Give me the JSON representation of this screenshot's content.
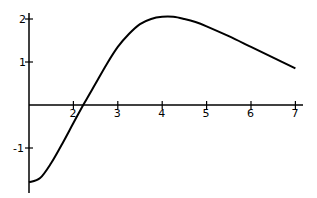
{
  "chart_data": {
    "type": "line",
    "title": "",
    "xlabel": "",
    "ylabel": "",
    "xlim": [
      1,
      7.2
    ],
    "ylim": [
      -1.9,
      2.2
    ],
    "grid": false,
    "legend": null,
    "x_ticks": [
      "2",
      "3",
      "4",
      "5",
      "6",
      "7"
    ],
    "y_ticks": [
      "2",
      "1",
      "-1"
    ],
    "series": [
      {
        "name": "f(x)",
        "x": [
          1.0,
          1.25,
          1.5,
          1.75,
          2.0,
          2.25,
          2.5,
          2.75,
          3.0,
          3.25,
          3.5,
          3.75,
          4.0,
          4.25,
          4.5,
          4.75,
          5.0,
          5.5,
          6.0,
          6.5,
          7.0
        ],
        "values": [
          -1.8,
          -1.7,
          -1.35,
          -0.9,
          -0.42,
          0.05,
          0.5,
          0.95,
          1.35,
          1.65,
          1.88,
          2.0,
          2.05,
          2.05,
          2.0,
          1.93,
          1.83,
          1.6,
          1.35,
          1.1,
          0.85
        ]
      }
    ]
  }
}
